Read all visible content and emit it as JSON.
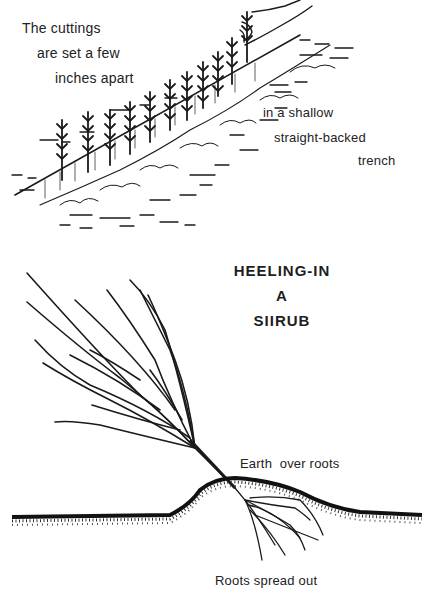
{
  "top_figure": {
    "caption_lines": [
      "The cuttings",
      "are set a few",
      "inches apart"
    ],
    "trench_lines": [
      "in a shallow",
      "straight-backed",
      "trench"
    ]
  },
  "bottom_figure": {
    "title_lines": [
      "HEELING-IN",
      "A",
      "SIIRUB"
    ],
    "earth_label": "Earth  over roots",
    "roots_label": "Roots spread out"
  },
  "colors": {
    "ink": "#1a1a1a",
    "background": "#ffffff"
  }
}
